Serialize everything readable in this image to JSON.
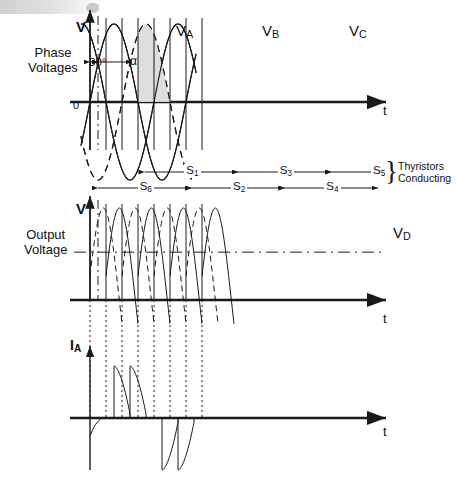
{
  "figure": {
    "title_hidden": "Three-phase full-wave controlled rectifier waveforms",
    "background": "#ffffff",
    "ink": "#1a1a1a",
    "shade_color": "#dcdcdc"
  },
  "labels": {
    "phase_voltages": "Phase\nVoltages",
    "output_voltage": "Output\nVoltage",
    "thyristors_conducting": "Thyristors\nConducting",
    "axis_v1": "V",
    "axis_v2": "V",
    "axis_i": "I",
    "axis_i_sub": "A",
    "axis_t1": "t",
    "axis_t2": "t",
    "axis_t3": "t",
    "origin": "0",
    "angle_delay": "30°",
    "angle_alpha": "α",
    "va": "V",
    "va_sub": "A",
    "vb": "V",
    "vb_sub": "B",
    "vc": "V",
    "vc_sub": "C",
    "vd": "V",
    "vd_sub": "D"
  },
  "thyristor_sequence": {
    "upper_row": [
      {
        "name": "S",
        "sub": "1"
      },
      {
        "name": "S",
        "sub": "3"
      },
      {
        "name": "S",
        "sub": "5"
      }
    ],
    "lower_row": [
      {
        "name": "S",
        "sub": "6"
      },
      {
        "name": "S",
        "sub": "2"
      },
      {
        "name": "S",
        "sub": "4"
      }
    ]
  },
  "chart_data": {
    "type": "line",
    "xlabel": "t",
    "panels": [
      {
        "id": "phase-voltages",
        "ylabel": "V",
        "series": [
          {
            "name": "VA",
            "style": "solid",
            "phase_deg": 0
          },
          {
            "name": "VB",
            "style": "dashed",
            "phase_deg": 120
          },
          {
            "name": "VC",
            "style": "solid",
            "phase_deg": 240
          }
        ],
        "firing_angle_deg": 30,
        "delay_marker_deg": 30,
        "shaded_region": {
          "series": "VB",
          "note": "conduction area under VB"
        }
      },
      {
        "id": "output-voltage",
        "ylabel": "V",
        "average_level_label": "VD",
        "ripple_pulses": 6
      },
      {
        "id": "phase-a-current",
        "ylabel": "IA",
        "positive_pulses": 2,
        "negative_pulses": 2,
        "conduction_deg": 120
      }
    ]
  }
}
